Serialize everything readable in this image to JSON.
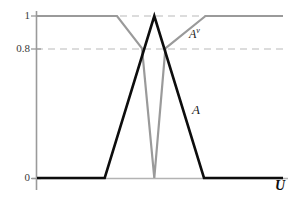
{
  "chart_data": {
    "type": "line",
    "title": "",
    "subtitle": "",
    "xlabel": "U",
    "ylabel": "",
    "xlim": [
      0,
      100
    ],
    "ylim": [
      0,
      1
    ],
    "grid": false,
    "gridlines_dashed_y": [
      1,
      0.8
    ],
    "y_tick_labels": [
      "1",
      "0.8",
      "0"
    ],
    "y_tick_values": [
      1,
      0.8,
      0
    ],
    "x_tick_labels": [],
    "legend_position": "inline-annotation",
    "series": [
      {
        "name": "A",
        "label": "A",
        "color": "#0d0d0d",
        "linewidth": 2.6,
        "style": "solid",
        "description": "Triangular membership function peaking at 1",
        "points": [
          {
            "x": 0.0,
            "y": 0.0
          },
          {
            "x": 27.5,
            "y": 0.0
          },
          {
            "x": 47.7,
            "y": 1.0
          },
          {
            "x": 67.9,
            "y": 0.0
          },
          {
            "x": 100.0,
            "y": 0.0
          }
        ]
      },
      {
        "name": "A^v",
        "label": "A",
        "label_superscript": "v",
        "color": "#9a9a9a",
        "linewidth": 2.2,
        "style": "solid",
        "description": "Complement-like curve at 1 with a V notch dipping to 0",
        "points": [
          {
            "x": 0.0,
            "y": 1.0
          },
          {
            "x": 32.5,
            "y": 1.0
          },
          {
            "x": 42.7,
            "y": 0.8
          },
          {
            "x": 47.7,
            "y": 0.0
          },
          {
            "x": 52.2,
            "y": 0.8
          },
          {
            "x": 68.5,
            "y": 1.0
          },
          {
            "x": 100.0,
            "y": 1.0
          }
        ]
      }
    ],
    "annotations": [
      {
        "text": "A",
        "superscript": "v",
        "x": 64.0,
        "y": 0.895,
        "style": "italic"
      },
      {
        "text": "A",
        "x": 65.4,
        "y": 0.47,
        "style": "italic"
      }
    ],
    "colors": {
      "series_A": "#0d0d0d",
      "series_Av": "#9a9a9a",
      "axis": "#9a9a9a",
      "dashed_gridline": "#b9b9b9",
      "tick_text": "#3a3a3a",
      "background": "#ffffff"
    }
  },
  "axes": {
    "y_ticks": [
      {
        "label": "1",
        "value": 1
      },
      {
        "label": "0.8",
        "value": 0.8
      },
      {
        "label": "0",
        "value": 0
      }
    ],
    "x_axis_label": "U"
  },
  "labels": {
    "av_base": "A",
    "av_sup": "v",
    "a": "A",
    "u": "U",
    "tick_1": "1",
    "tick_08": "0.8",
    "tick_0": "0"
  }
}
